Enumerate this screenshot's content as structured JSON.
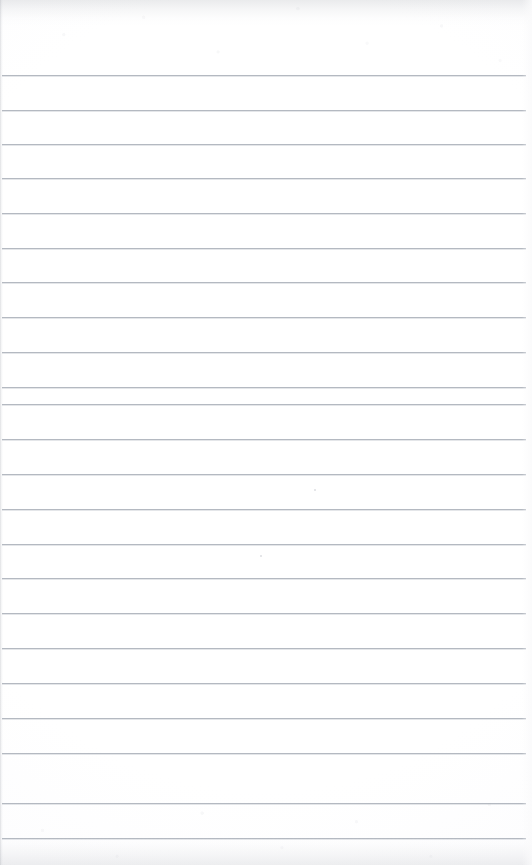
{
  "document": {
    "kind": "scanned-lined-notebook-page",
    "surface_label": "blank ruled notebook page",
    "page_width": 532,
    "page_height": 865,
    "visible_text": "",
    "handwriting_present": false,
    "printed_text_present": false
  },
  "colors": {
    "paper": "#ffffff",
    "paper_edge": "#fbfbfc",
    "rule_line": "#b4b9c1",
    "rule_line_highlight": "#cdd1d7",
    "scan_shadow": "#969aa2",
    "speck": "#b2b6be"
  },
  "layout": {
    "top_margin_px": 75,
    "bottom_margin_px": 27,
    "rule_left_x": 2,
    "rule_right_x": 526,
    "rule_width_px": 524,
    "rule_spacing_px": 34.7,
    "rule_thickness_px": 1,
    "rule_count": 23
  },
  "ruled_lines": [
    {
      "index": 1,
      "y": 75
    },
    {
      "index": 2,
      "y": 110
    },
    {
      "index": 3,
      "y": 144
    },
    {
      "index": 4,
      "y": 178
    },
    {
      "index": 5,
      "y": 213
    },
    {
      "index": 6,
      "y": 248
    },
    {
      "index": 7,
      "y": 282
    },
    {
      "index": 8,
      "y": 317
    },
    {
      "index": 9,
      "y": 352
    },
    {
      "index": 10,
      "y": 387
    },
    {
      "index": 11,
      "y": 404
    },
    {
      "index": 12,
      "y": 439
    },
    {
      "index": 13,
      "y": 474
    },
    {
      "index": 14,
      "y": 509
    },
    {
      "index": 15,
      "y": 544
    },
    {
      "index": 16,
      "y": 578
    },
    {
      "index": 17,
      "y": 613
    },
    {
      "index": 18,
      "y": 648
    },
    {
      "index": 19,
      "y": 683
    },
    {
      "index": 20,
      "y": 718
    },
    {
      "index": 21,
      "y": 753
    },
    {
      "index": 22,
      "y": 803
    },
    {
      "index": 23,
      "y": 838
    }
  ],
  "specks": [
    {
      "x": 260,
      "y": 555
    },
    {
      "x": 314,
      "y": 489
    }
  ]
}
